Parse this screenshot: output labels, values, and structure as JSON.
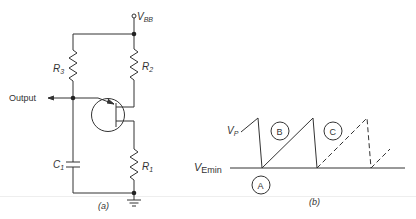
{
  "figure": {
    "panel_a": {
      "caption": "(a)",
      "supply_label": "V",
      "supply_sub": "BB",
      "output_label": "Output",
      "components": {
        "R1": {
          "letter": "R",
          "sub": "1"
        },
        "R2": {
          "letter": "R",
          "sub": "2"
        },
        "R3": {
          "letter": "R",
          "sub": "3"
        },
        "C1": {
          "letter": "C",
          "sub": "1"
        }
      },
      "device": "unijunction-transistor"
    },
    "panel_b": {
      "caption": "(b)",
      "vp_letter": "V",
      "vp_sub": "P",
      "vemin_letter": "V",
      "vemin_sub": "Emin",
      "markers": [
        "A",
        "B",
        "C"
      ]
    }
  },
  "colors": {
    "line": "#333333",
    "text": "#333333",
    "background": "#ffffff"
  }
}
